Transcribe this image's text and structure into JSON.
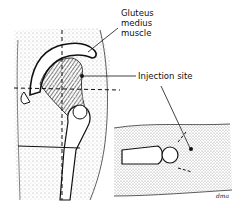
{
  "figure": {
    "labels": {
      "gluteus_line1": "Gluteus",
      "gluteus_line2": "medius",
      "gluteus_line3": "muscle",
      "injection_site": "Injection site"
    },
    "signature": "dma"
  },
  "colors": {
    "ink": "#111111",
    "stipple": "#8a8a8a",
    "background": "#ffffff"
  }
}
